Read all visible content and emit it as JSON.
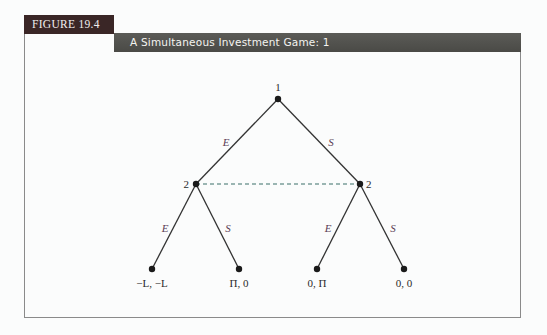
{
  "figure": {
    "number_label": "FIGURE 19.4",
    "title": "A Simultaneous Investment Game: 1"
  },
  "tree": {
    "nodes": {
      "root": {
        "label": "1",
        "x": 278,
        "y": 99
      },
      "left": {
        "label": "2",
        "x": 196,
        "y": 184
      },
      "right": {
        "label": "2",
        "x": 360,
        "y": 184
      }
    },
    "edges": {
      "root_left": "E",
      "root_right": "S",
      "left_left": "E",
      "left_right": "S",
      "right_left": "E",
      "right_right": "S"
    },
    "info_set": "dashed line connecting player 2 nodes",
    "payoffs": [
      {
        "label": "−L, −L",
        "x": 152,
        "y": 269
      },
      {
        "label": "Π, 0",
        "x": 239,
        "y": 269
      },
      {
        "label": "0, Π",
        "x": 317,
        "y": 269
      },
      {
        "label": "0, 0",
        "x": 404,
        "y": 269
      }
    ]
  },
  "colors": {
    "fig_label_bg": "#3a2626",
    "title_bar_bg": "#52524e",
    "info_set_line": "#3a6e68",
    "edge": "#333333"
  }
}
